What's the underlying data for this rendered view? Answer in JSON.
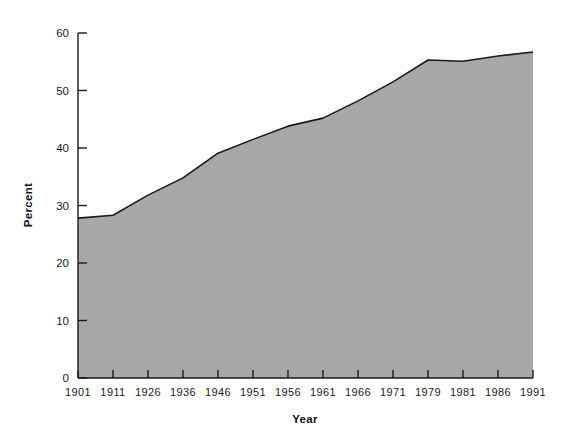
{
  "chart_data": {
    "type": "area",
    "title": "",
    "xlabel": "Year",
    "ylabel": "Percent",
    "categories": [
      "1901",
      "1911",
      "1926",
      "1936",
      "1946",
      "1951",
      "1956",
      "1961",
      "1966",
      "1971",
      "1979",
      "1981",
      "1986",
      "1991"
    ],
    "values": [
      27.8,
      28.3,
      31.8,
      34.8,
      39.1,
      41.5,
      43.8,
      45.2,
      48.2,
      51.5,
      55.3,
      55.1,
      56.0,
      56.7
    ],
    "series": [
      {
        "name": "Percent",
        "values": [
          27.8,
          28.3,
          31.8,
          34.8,
          39.1,
          41.5,
          43.8,
          45.2,
          48.2,
          51.5,
          55.3,
          55.1,
          56.0,
          56.7
        ]
      }
    ],
    "ylim": [
      0,
      60
    ],
    "yticks": [
      0,
      10,
      20,
      30,
      40,
      50,
      60
    ],
    "ytick_labels": [
      "0",
      "10",
      "20",
      "30",
      "40",
      "50",
      "60"
    ],
    "xtick_labels": [
      "1901",
      "1911",
      "1926",
      "1936",
      "1946",
      "1951",
      "1956",
      "1961",
      "1966",
      "1971",
      "1979",
      "1981",
      "1986",
      "1991"
    ],
    "grid": false,
    "legend": null,
    "legend_position": "none",
    "fill_color": "#a8a8a8",
    "line_color": "#1a1a1a",
    "axis_color": "#1a1a1a",
    "background_color": "#ffffff",
    "annotations": []
  },
  "axes": {
    "x_title": "Year",
    "y_title": "Percent"
  }
}
